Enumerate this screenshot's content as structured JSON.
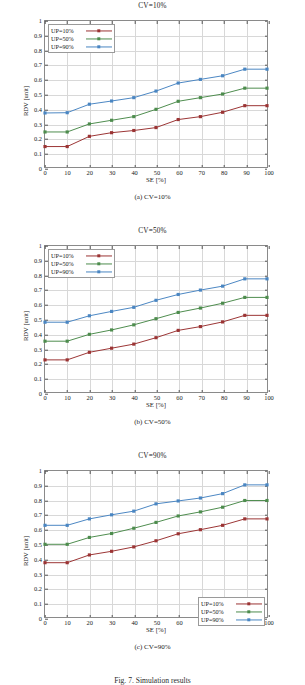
{
  "figure": {
    "caption": "Fig. 7. Simulation results"
  },
  "axes": {
    "xlabel": "SE [%]",
    "ylabel": "RDV [unit]",
    "xticks": [
      "0",
      "10",
      "20",
      "30",
      "40",
      "50",
      "60",
      "70",
      "80",
      "90",
      "100"
    ],
    "yticks": [
      "0",
      "0.1",
      "0.2",
      "0.3",
      "0.4",
      "0.5",
      "0.6",
      "0.7",
      "0.8",
      "0.9",
      "1"
    ]
  },
  "colors": {
    "up10": "#9b3434",
    "up50": "#4d8c4d",
    "up90": "#4a86c2",
    "grid": "#d8d8d8",
    "frame": "#8a8a8a"
  },
  "panels": [
    {
      "id": "a",
      "title": "CV=10%",
      "subcaption": "(a) CV=10%",
      "legend_position": "top-left",
      "chart_data": {
        "type": "line",
        "title": "CV=10%",
        "xlabel": "SE [%]",
        "ylabel": "RDV [unit]",
        "xlim": [
          0,
          100
        ],
        "ylim": [
          0,
          1
        ],
        "grid": true,
        "legend": "top-left",
        "x": [
          0,
          10,
          20,
          30,
          40,
          50,
          60,
          70,
          80,
          90,
          100
        ],
        "series": [
          {
            "name": "UP=10%",
            "color": "#9b3434",
            "values": [
              0.14,
              0.14,
              0.21,
              0.235,
              0.25,
              0.27,
              0.325,
              0.345,
              0.375,
              0.42,
              0.42
            ]
          },
          {
            "name": "UP=50%",
            "color": "#4d8c4d",
            "values": [
              0.24,
              0.24,
              0.295,
              0.32,
              0.345,
              0.395,
              0.45,
              0.475,
              0.5,
              0.54,
              0.54
            ]
          },
          {
            "name": "UP=90%",
            "color": "#4a86c2",
            "values": [
              0.37,
              0.372,
              0.43,
              0.452,
              0.475,
              0.52,
              0.575,
              0.6,
              0.625,
              0.67,
              0.67
            ]
          }
        ]
      }
    },
    {
      "id": "b",
      "title": "CV=50%",
      "subcaption": "(b) CV=50%",
      "legend_position": "top-left",
      "chart_data": {
        "type": "line",
        "title": "CV=50%",
        "xlabel": "SE [%]",
        "ylabel": "RDV [unit]",
        "xlim": [
          0,
          100
        ],
        "ylim": [
          0,
          1
        ],
        "grid": true,
        "legend": "top-left",
        "x": [
          0,
          10,
          20,
          30,
          40,
          50,
          60,
          70,
          80,
          90,
          100
        ],
        "series": [
          {
            "name": "UP=10%",
            "color": "#9b3434",
            "values": [
              0.22,
              0.22,
              0.272,
              0.3,
              0.328,
              0.372,
              0.422,
              0.448,
              0.48,
              0.525,
              0.525
            ]
          },
          {
            "name": "UP=50%",
            "color": "#4d8c4d",
            "values": [
              0.348,
              0.348,
              0.395,
              0.425,
              0.46,
              0.502,
              0.545,
              0.575,
              0.608,
              0.648,
              0.648
            ]
          },
          {
            "name": "UP=90%",
            "color": "#4a86c2",
            "values": [
              0.478,
              0.478,
              0.522,
              0.552,
              0.58,
              0.628,
              0.668,
              0.698,
              0.725,
              0.775,
              0.775
            ]
          }
        ]
      }
    },
    {
      "id": "c",
      "title": "CV=90%",
      "subcaption": "(c) CV=90%",
      "legend_position": "bottom-right",
      "chart_data": {
        "type": "line",
        "title": "CV=90%",
        "xlabel": "SE [%]",
        "ylabel": "RDV [unit]",
        "xlim": [
          0,
          100
        ],
        "ylim": [
          0,
          1
        ],
        "grid": true,
        "legend": "bottom-right",
        "x": [
          0,
          10,
          20,
          30,
          40,
          50,
          60,
          70,
          80,
          90,
          100
        ],
        "series": [
          {
            "name": "UP=10%",
            "color": "#9b3434",
            "values": [
              0.372,
              0.372,
              0.425,
              0.45,
              0.48,
              0.522,
              0.57,
              0.598,
              0.628,
              0.672,
              0.672
            ]
          },
          {
            "name": "UP=50%",
            "color": "#4d8c4d",
            "values": [
              0.498,
              0.498,
              0.545,
              0.572,
              0.608,
              0.648,
              0.692,
              0.72,
              0.752,
              0.798,
              0.798
            ]
          },
          {
            "name": "UP=90%",
            "color": "#4a86c2",
            "values": [
              0.628,
              0.628,
              0.672,
              0.7,
              0.725,
              0.775,
              0.795,
              0.815,
              0.845,
              0.905,
              0.905
            ]
          }
        ]
      }
    }
  ]
}
